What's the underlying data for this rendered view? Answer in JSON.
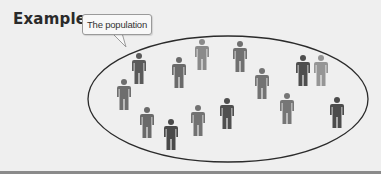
{
  "heading": "Example",
  "callout": {
    "label": "The population",
    "icon": "speech-bubble"
  },
  "population": {
    "shape": "ellipse",
    "ellipse": {
      "cx": 228,
      "cy": 99,
      "rx": 140,
      "ry": 63,
      "stroke": "#2b2b2b"
    },
    "person_icon": "person-icon",
    "people": [
      {
        "x": 139,
        "y": 53,
        "color": "#5a5a5a"
      },
      {
        "x": 179,
        "y": 57,
        "color": "#6a6a6a"
      },
      {
        "x": 202,
        "y": 39,
        "color": "#8a8a8a"
      },
      {
        "x": 240,
        "y": 41,
        "color": "#707070"
      },
      {
        "x": 262,
        "y": 68,
        "color": "#737373"
      },
      {
        "x": 303,
        "y": 55,
        "color": "#4e4e4e"
      },
      {
        "x": 321,
        "y": 55,
        "color": "#959595"
      },
      {
        "x": 124,
        "y": 79,
        "color": "#6e6e6e"
      },
      {
        "x": 147,
        "y": 107,
        "color": "#6a6a6a"
      },
      {
        "x": 171,
        "y": 119,
        "color": "#4a4a4a"
      },
      {
        "x": 198,
        "y": 105,
        "color": "#727272"
      },
      {
        "x": 227,
        "y": 98,
        "color": "#4f4f4f"
      },
      {
        "x": 287,
        "y": 93,
        "color": "#767676"
      },
      {
        "x": 337,
        "y": 97,
        "color": "#4c4c4c"
      }
    ]
  }
}
